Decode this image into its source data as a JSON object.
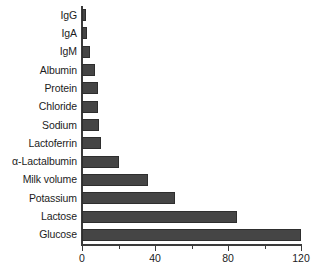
{
  "chart_data": {
    "type": "bar",
    "orientation": "horizontal",
    "title": "",
    "subtitle": "",
    "xlabel": "",
    "ylabel": "",
    "xlim": [
      0,
      125
    ],
    "xticks": [
      0,
      40,
      80,
      120
    ],
    "xtick_labels": [
      "0",
      "40",
      "80",
      "120"
    ],
    "minor_xticks": [
      20,
      60,
      100
    ],
    "grid": false,
    "legend": null,
    "bar_color": "#454545",
    "bar_edge_color": "#2e2e2e",
    "axis_color": "#3b3b3b",
    "background": "#ffffff",
    "categories": [
      "IgG",
      "IgA",
      "IgM",
      "Albumin",
      "Protein",
      "Chloride",
      "Sodium",
      "Lactoferrin",
      "α-Lactalbumin",
      "Milk volume",
      "Potassium",
      "Lactose",
      "Glucose"
    ],
    "values": [
      2,
      3,
      4.5,
      7,
      8.5,
      9,
      9.5,
      10.5,
      20,
      36,
      51,
      85,
      121
    ]
  }
}
